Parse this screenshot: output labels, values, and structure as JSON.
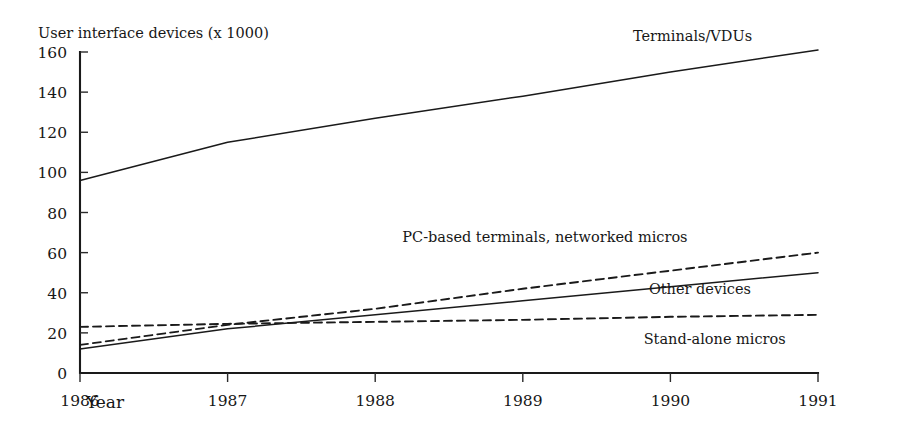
{
  "chart_data": {
    "type": "line",
    "title": "",
    "ylabel": "User interface devices (x 1000)",
    "xlabel": "Year",
    "x": [
      1986,
      1987,
      1988,
      1989,
      1990,
      1991
    ],
    "xtick_labels": [
      "1986",
      "1987",
      "1988",
      "1989",
      "1990",
      "1991"
    ],
    "ytick_labels": [
      "0",
      "20",
      "40",
      "60",
      "80",
      "100",
      "120",
      "140",
      "160"
    ],
    "ytick_values": [
      0,
      20,
      40,
      60,
      80,
      100,
      120,
      140,
      160
    ],
    "ylim": [
      0,
      160
    ],
    "xlim": [
      1986,
      1991
    ],
    "grid": false,
    "legend_position": "inline-right-annotations",
    "series": [
      {
        "name": "Terminals/VDUs",
        "style": "solid",
        "values": [
          96,
          115,
          127,
          138,
          150,
          161
        ],
        "label_x": 1990.15,
        "label_y": 168,
        "label_anchor": "middle"
      },
      {
        "name": "PC-based terminals, networked micros",
        "style": "dashed",
        "values": [
          14,
          24,
          32,
          42,
          51,
          60
        ],
        "label_x": 1989.15,
        "label_y": 68,
        "label_anchor": "middle"
      },
      {
        "name": "Other devices",
        "style": "solid",
        "values": [
          12,
          22,
          29,
          36,
          43,
          50
        ],
        "label_x": 1990.2,
        "label_y": 42,
        "label_anchor": "middle"
      },
      {
        "name": "Stand-alone micros",
        "style": "dashed",
        "values": [
          23,
          24.5,
          25.5,
          26.5,
          28,
          29
        ],
        "label_x": 1990.3,
        "label_y": 17,
        "label_anchor": "middle"
      }
    ]
  },
  "axis": {
    "y_axis_title": "User interface devices (x 1000)",
    "x_axis_title": "Year"
  }
}
